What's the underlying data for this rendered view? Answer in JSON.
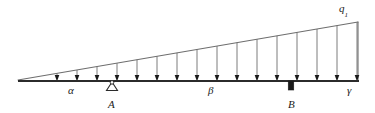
{
  "figure": {
    "kind": "structural-beam-diagram",
    "width": 375,
    "height": 113,
    "background_color": "#ffffff",
    "line_color": "#2b2b2b",
    "load_line_color": "#6e6e6e",
    "text_color": "#1a1a1a"
  },
  "beam": {
    "name": "beam-baseline",
    "x_start": 18,
    "x_end": 359,
    "y": 81,
    "thickness": 2.2
  },
  "load_envelope": {
    "name": "triangular-load-hypotenuse",
    "apex_x": 18,
    "apex_y": 80,
    "peak_x": 358,
    "peak_y": 22,
    "right_edge_top_y": 22,
    "right_edge_bottom_y": 80
  },
  "load_arrows": {
    "count": 16,
    "spacing": 20,
    "first_x": 57,
    "last_x": 357,
    "baseline_y": 81,
    "direction": "down",
    "head_width": 4.6,
    "head_length": 7.5,
    "x_positions": [
      57,
      77,
      97,
      117,
      137,
      157,
      177,
      197,
      217,
      237,
      257,
      277,
      297,
      317,
      337,
      357
    ],
    "top_y_positions": [
      73.4,
      70.0,
      66.6,
      63.2,
      59.7,
      56.3,
      52.9,
      49.5,
      46.1,
      42.7,
      39.2,
      35.8,
      32.4,
      29.0,
      25.6,
      22.2
    ]
  },
  "labels": {
    "load_intensity": {
      "text": "q",
      "subscript": "1",
      "x": 339,
      "y": 3
    },
    "segment_alpha": {
      "text": "α",
      "x": 68,
      "y": 85
    },
    "support_a": {
      "text": "A",
      "x": 108,
      "y": 99
    },
    "segment_beta": {
      "text": "β",
      "x": 208,
      "y": 85
    },
    "support_b": {
      "text": "B",
      "x": 288,
      "y": 99
    },
    "segment_gamma": {
      "text": "γ",
      "x": 347,
      "y": 85
    }
  },
  "supports": {
    "pin_support_a": {
      "name": "pin-support-triangle",
      "apex_x": 112,
      "apex_y": 82,
      "half_width": 5.5,
      "height": 8.5,
      "pin_circle_radius": 1.8
    },
    "roller_support_b": {
      "name": "fixed-block-support",
      "center_x": 291,
      "top_y": 81,
      "width": 5.5,
      "height": 9
    }
  }
}
